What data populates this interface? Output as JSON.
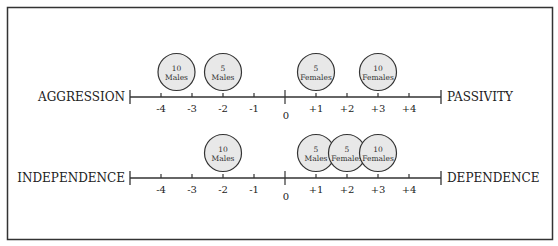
{
  "frame": {
    "border_color": "#333333",
    "background": "#ffffff"
  },
  "scales": [
    {
      "id": "aggression-passivity",
      "left_label": "AGGRESSION",
      "right_label": "PASSIVITY",
      "ticks": [
        "-4",
        "-3",
        "-2",
        "-1",
        "0",
        "+1",
        "+2",
        "+3",
        "+4"
      ],
      "groups": [
        {
          "count": "10",
          "sex": "Males",
          "position": -3.5
        },
        {
          "count": "5",
          "sex": "Males",
          "position": -2
        },
        {
          "count": "5",
          "sex": "Females",
          "position": 1
        },
        {
          "count": "10",
          "sex": "Females",
          "position": 3
        }
      ]
    },
    {
      "id": "independence-dependence",
      "left_label": "INDEPENDENCE",
      "right_label": "DEPENDENCE",
      "ticks": [
        "-4",
        "-3",
        "-2",
        "-1",
        "0",
        "+1",
        "+2",
        "+3",
        "+4"
      ],
      "groups": [
        {
          "count": "10",
          "sex": "Males",
          "position": -2
        },
        {
          "count": "5",
          "sex": "Males",
          "position": 1
        },
        {
          "count": "5",
          "sex": "Females",
          "position": 2
        },
        {
          "count": "10",
          "sex": "Females",
          "position": 3
        }
      ]
    }
  ],
  "colors": {
    "line": "#333333",
    "circle_fill": "#e8e8e8",
    "circle_stroke": "#333333",
    "text": "#222222"
  }
}
